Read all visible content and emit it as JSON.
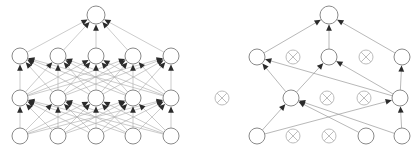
{
  "figure": {
    "caption_partial": "",
    "colors": {
      "node_stroke": "#8a8a8a",
      "dropped_stroke": "#bdbdbd",
      "edge": "#a9a9a9",
      "arrow": "#2b2b2b",
      "background": "#ffffff"
    },
    "panels": [
      {
        "id": "left",
        "name": "standard-neural-net",
        "label": "",
        "layers": [
          {
            "name": "input-layer",
            "y": 136,
            "nodes": [
              {
                "id": "L-in-1",
                "x": 20,
                "r": 8,
                "state": "active"
              },
              {
                "id": "L-in-2",
                "x": 58,
                "r": 8,
                "state": "active"
              },
              {
                "id": "L-in-3",
                "x": 96,
                "r": 8,
                "state": "active"
              },
              {
                "id": "L-in-4",
                "x": 133,
                "r": 8,
                "state": "active"
              },
              {
                "id": "L-in-5",
                "x": 171,
                "r": 8,
                "state": "active"
              }
            ]
          },
          {
            "name": "hidden-layer-1",
            "y": 98,
            "nodes": [
              {
                "id": "L-h1-1",
                "x": 20,
                "r": 8,
                "state": "active"
              },
              {
                "id": "L-h1-2",
                "x": 58,
                "r": 8,
                "state": "active"
              },
              {
                "id": "L-h1-3",
                "x": 96,
                "r": 8,
                "state": "active"
              },
              {
                "id": "L-h1-4",
                "x": 133,
                "r": 8,
                "state": "active"
              },
              {
                "id": "L-h1-5",
                "x": 171,
                "r": 8,
                "state": "active"
              }
            ]
          },
          {
            "name": "hidden-layer-2",
            "y": 56,
            "nodes": [
              {
                "id": "L-h2-1",
                "x": 20,
                "r": 8,
                "state": "active"
              },
              {
                "id": "L-h2-2",
                "x": 58,
                "r": 8,
                "state": "active"
              },
              {
                "id": "L-h2-3",
                "x": 96,
                "r": 8,
                "state": "active"
              },
              {
                "id": "L-h2-4",
                "x": 133,
                "r": 8,
                "state": "active"
              },
              {
                "id": "L-h2-5",
                "x": 171,
                "r": 8,
                "state": "active"
              }
            ]
          },
          {
            "name": "output-layer",
            "y": 15,
            "nodes": [
              {
                "id": "L-out-1",
                "x": 96,
                "r": 9,
                "state": "active"
              }
            ]
          }
        ],
        "connectivity": "fully-connected"
      },
      {
        "id": "right",
        "name": "thinned-net-after-dropout",
        "label": "",
        "layers": [
          {
            "name": "input-layer",
            "y": 136,
            "nodes": [
              {
                "id": "R-in-1",
                "x": 257,
                "r": 8,
                "state": "active"
              },
              {
                "id": "R-in-2",
                "x": 293,
                "r": 7,
                "state": "dropped"
              },
              {
                "id": "R-in-3",
                "x": 329,
                "r": 7,
                "state": "dropped"
              },
              {
                "id": "R-in-4",
                "x": 366,
                "r": 8,
                "state": "active"
              },
              {
                "id": "R-in-5",
                "x": 402,
                "r": 8,
                "state": "active"
              }
            ]
          },
          {
            "name": "hidden-layer-1",
            "y": 98,
            "nodes": [
              {
                "id": "R-h1-1",
                "x": 222,
                "r": 7,
                "state": "dropped"
              },
              {
                "id": "R-h1-2",
                "x": 291,
                "r": 8,
                "state": "active"
              },
              {
                "id": "R-h1-3",
                "x": 327,
                "r": 7,
                "state": "dropped"
              },
              {
                "id": "R-h1-4",
                "x": 364,
                "r": 7,
                "state": "dropped"
              },
              {
                "id": "R-h1-5",
                "x": 400,
                "r": 8,
                "state": "active"
              }
            ]
          },
          {
            "name": "hidden-layer-2",
            "y": 57,
            "nodes": [
              {
                "id": "R-h2-1",
                "x": 257,
                "r": 8,
                "state": "active"
              },
              {
                "id": "R-h2-2",
                "x": 293,
                "r": 7,
                "state": "dropped"
              },
              {
                "id": "R-h2-3",
                "x": 329,
                "r": 8,
                "state": "active"
              },
              {
                "id": "R-h2-4",
                "x": 366,
                "r": 7,
                "state": "dropped"
              },
              {
                "id": "R-h2-5",
                "x": 402,
                "r": 8,
                "state": "active"
              }
            ]
          },
          {
            "name": "output-layer",
            "y": 15,
            "nodes": [
              {
                "id": "R-out-1",
                "x": 329,
                "r": 9,
                "state": "active"
              }
            ]
          }
        ],
        "connectivity": "sparse-after-dropout",
        "active_edges": [
          {
            "from": "R-in-1",
            "to": "R-h1-2"
          },
          {
            "from": "R-in-1",
            "to": "R-h1-5"
          },
          {
            "from": "R-in-4",
            "to": "R-h1-2"
          },
          {
            "from": "R-in-5",
            "to": "R-h1-2"
          },
          {
            "from": "R-in-5",
            "to": "R-h1-5"
          },
          {
            "from": "R-h1-2",
            "to": "R-h2-1"
          },
          {
            "from": "R-h1-2",
            "to": "R-h2-3"
          },
          {
            "from": "R-h1-5",
            "to": "R-h2-1"
          },
          {
            "from": "R-h1-5",
            "to": "R-h2-3"
          },
          {
            "from": "R-h1-5",
            "to": "R-h2-5"
          },
          {
            "from": "R-h2-1",
            "to": "R-out-1"
          },
          {
            "from": "R-h2-3",
            "to": "R-out-1"
          },
          {
            "from": "R-h2-5",
            "to": "R-out-1"
          }
        ]
      }
    ]
  }
}
